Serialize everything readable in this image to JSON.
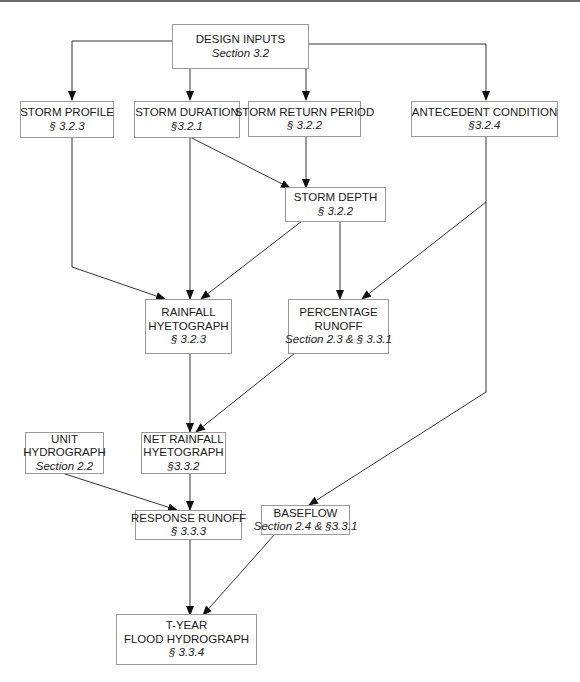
{
  "diagram": {
    "nodes": {
      "design_inputs": {
        "title": "DESIGN  INPUTS",
        "ref": "Section 3.2"
      },
      "storm_profile": {
        "title": "STORM PROFILE",
        "ref": "§ 3.2.3"
      },
      "storm_duration": {
        "title": "STORM DURATION",
        "ref": "§3.2.1"
      },
      "storm_return_period": {
        "title": "STORM RETURN PERIOD",
        "ref": "§ 3.2.2"
      },
      "antecedent_condition": {
        "title": "ANTECEDENT CONDITION",
        "ref": "§3.2.4"
      },
      "storm_depth": {
        "title": "STORM DEPTH",
        "ref": "§ 3.2.2"
      },
      "rainfall_hyetograph": {
        "title_1": "RAINFALL",
        "title_2": "HYETOGRAPH",
        "ref": "§ 3.2.3"
      },
      "percentage_runoff": {
        "title_1": "PERCENTAGE",
        "title_2": "RUNOFF",
        "ref": "Section 2.3 &   § 3.3.1"
      },
      "unit_hydrograph": {
        "title_1": "UNIT",
        "title_2": "HYDROGRAPH",
        "ref": "Section 2.2"
      },
      "net_rainfall_hyetograph": {
        "title_1": "NET RAINFALL",
        "title_2": "HYETOGRAPH",
        "ref": "§3.3.2"
      },
      "response_runoff": {
        "title": "RESPONSE RUNOFF",
        "ref": "§ 3.3.3"
      },
      "baseflow": {
        "title": "BASEFLOW",
        "ref": "Section 2.4 & §3.3.1"
      },
      "flood_hydrograph": {
        "title_1": "T-YEAR",
        "title_2": "FLOOD HYDROGRAPH",
        "ref": "§ 3.3.4"
      }
    },
    "edges": [
      [
        "design_inputs",
        "storm_profile"
      ],
      [
        "design_inputs",
        "storm_duration"
      ],
      [
        "design_inputs",
        "storm_return_period"
      ],
      [
        "design_inputs",
        "antecedent_condition"
      ],
      [
        "storm_duration",
        "storm_depth"
      ],
      [
        "storm_return_period",
        "storm_depth"
      ],
      [
        "storm_profile",
        "rainfall_hyetograph"
      ],
      [
        "storm_duration",
        "rainfall_hyetograph"
      ],
      [
        "storm_depth",
        "rainfall_hyetograph"
      ],
      [
        "storm_depth",
        "percentage_runoff"
      ],
      [
        "antecedent_condition",
        "percentage_runoff"
      ],
      [
        "rainfall_hyetograph",
        "net_rainfall_hyetograph"
      ],
      [
        "percentage_runoff",
        "net_rainfall_hyetograph"
      ],
      [
        "unit_hydrograph",
        "response_runoff"
      ],
      [
        "net_rainfall_hyetograph",
        "response_runoff"
      ],
      [
        "antecedent_condition",
        "baseflow"
      ],
      [
        "response_runoff",
        "flood_hydrograph"
      ],
      [
        "baseflow",
        "flood_hydrograph"
      ]
    ]
  }
}
